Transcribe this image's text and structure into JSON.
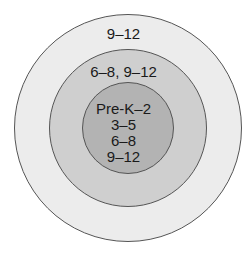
{
  "diagram": {
    "type": "concentric-circles",
    "rings": [
      {
        "level": "outer",
        "label": "9–12",
        "color": "#ececec"
      },
      {
        "level": "middle",
        "label": "6–8, 9–12",
        "color": "#cfcfcf"
      },
      {
        "level": "inner",
        "lines": [
          "Pre-K–2",
          "3–5",
          "6–8",
          "9–12"
        ],
        "color": "#b3b3b3"
      }
    ]
  }
}
